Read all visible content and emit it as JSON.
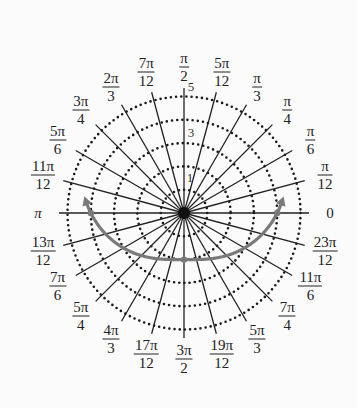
{
  "chart_data": {
    "type": "polar",
    "title": "",
    "rings": [
      1,
      2,
      3,
      4,
      5
    ],
    "ring_labels_shown": [
      "1",
      "3",
      "5"
    ],
    "spoke_angles": [
      "0",
      "π/12",
      "π/6",
      "π/4",
      "π/3",
      "5π/12",
      "π/2",
      "7π/12",
      "2π/3",
      "3π/4",
      "5π/6",
      "11π/12",
      "π",
      "13π/12",
      "7π/6",
      "5π/4",
      "4π/3",
      "17π/12",
      "3π/2",
      "19π/12",
      "5π/3",
      "7π/4",
      "11π/6",
      "23π/12"
    ],
    "curve": {
      "equation": "r = 4 + 2 sin θ",
      "theta_range": [
        "π",
        "2π"
      ],
      "points": [
        {
          "theta": "π",
          "r": 4
        },
        {
          "theta": "3π/2",
          "r": 2
        },
        {
          "theta": "2π",
          "r": 4
        }
      ],
      "color": "#7a7a7a",
      "arrows_at_both_ends": true
    }
  },
  "labels": [
    {
      "num": "π",
      "den": "2"
    },
    {
      "num": "5π",
      "den": "12"
    },
    {
      "num": "π",
      "den": "3"
    },
    {
      "num": "π",
      "den": "4"
    },
    {
      "num": "π",
      "den": "6"
    },
    {
      "num": "π",
      "den": "12"
    },
    {
      "single": "0"
    },
    {
      "num": "23π",
      "den": "12"
    },
    {
      "num": "11π",
      "den": "6"
    },
    {
      "num": "7π",
      "den": "4"
    },
    {
      "num": "5π",
      "den": "3"
    },
    {
      "num": "19π",
      "den": "12"
    },
    {
      "num": "3π",
      "den": "2"
    },
    {
      "num": "17π",
      "den": "12"
    },
    {
      "num": "4π",
      "den": "3"
    },
    {
      "num": "5π",
      "den": "4"
    },
    {
      "num": "7π",
      "den": "6"
    },
    {
      "num": "13π",
      "den": "12"
    },
    {
      "single": "π"
    },
    {
      "num": "11π",
      "den": "12"
    },
    {
      "num": "5π",
      "den": "6"
    },
    {
      "num": "3π",
      "den": "4"
    },
    {
      "num": "2π",
      "den": "3"
    },
    {
      "num": "7π",
      "den": "12"
    }
  ],
  "ring_text": {
    "r1": "1",
    "r3": "3",
    "r5": "5"
  }
}
